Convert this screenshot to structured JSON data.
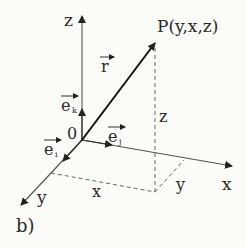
{
  "figure": {
    "caption": "b)",
    "point_label": "P(y,x,z)",
    "origin_label": "0",
    "vector_label": "r",
    "axes": {
      "z_label": "z",
      "x_label": "x",
      "y_label": "y"
    },
    "unit_vectors": {
      "k_base": "e",
      "k_sub": "k",
      "j_base": "e",
      "j_sub": "j",
      "i_base": "e",
      "i_sub": "i"
    },
    "projection_labels": {
      "vertical": "z",
      "along_x": "x",
      "along_y": "y"
    },
    "colors": {
      "axis": "#555555",
      "vector": "#111111",
      "dashed": "#666666",
      "text": "#2a2a2a",
      "background": "#fbfbf8"
    }
  }
}
